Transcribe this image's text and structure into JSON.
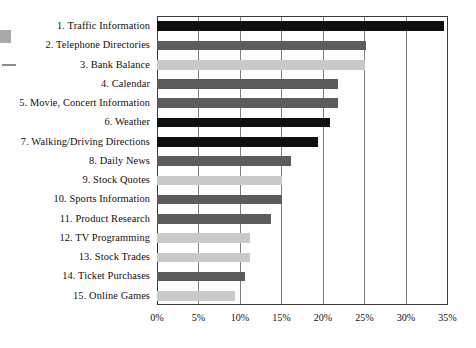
{
  "chart_data": {
    "type": "bar",
    "orientation": "horizontal",
    "title": "",
    "xlabel": "",
    "ylabel": "",
    "xlim": [
      0,
      35
    ],
    "grid": true,
    "legend": "none",
    "xticks": [
      "0%",
      "5%",
      "10%",
      "15%",
      "20%",
      "25%",
      "30%",
      "35%"
    ],
    "xtick_values": [
      0,
      5,
      10,
      15,
      20,
      25,
      30,
      35
    ],
    "categories": [
      "1. Traffic Information",
      "2. Telephone Directories",
      "3. Bank Balance",
      "4. Calendar",
      "5. Movie, Concert Information",
      "6. Weather",
      "7. Walking/Driving Directions",
      "8. Daily News",
      "9. Stock Quotes",
      "10. Sports Information",
      "11. Product Research",
      "12. TV Programming",
      "13. Stock Trades",
      "14. Ticket Purchases",
      "15. Online Games"
    ],
    "values": [
      34.6,
      25.2,
      25.0,
      21.8,
      21.8,
      20.9,
      19.4,
      16.2,
      15.0,
      15.1,
      13.7,
      11.2,
      11.2,
      10.6,
      9.4
    ],
    "bar_shades": [
      "black",
      "dark",
      "light",
      "dark",
      "dark",
      "black",
      "black",
      "dark",
      "light",
      "dark",
      "dark",
      "light",
      "light",
      "dark",
      "light"
    ],
    "colors": {
      "black": "#12100f",
      "dark": "#5d5c5b",
      "light": "#c9c9c7",
      "axis": "#3a3a3a",
      "grid": "#7e7e7e",
      "text": "#15100e",
      "background": "#ffffff"
    }
  }
}
